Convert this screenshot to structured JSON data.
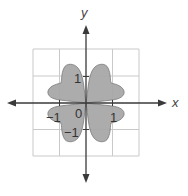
{
  "figure": {
    "type": "polar-curve-region",
    "axes": {
      "x_label": "x",
      "y_label": "y"
    },
    "ticks": {
      "x_positive": "1",
      "x_negative": "−1",
      "y_positive": "1",
      "y_negative": "−1",
      "origin": "0"
    },
    "grid": {
      "min": -2,
      "max": 2,
      "step": 1
    },
    "colors": {
      "fill": "#a8a8a8",
      "outline": "#7a7a7a",
      "grid": "#c9c9c9",
      "axis": "#3a3a3a",
      "background": "#ffffff"
    }
  }
}
